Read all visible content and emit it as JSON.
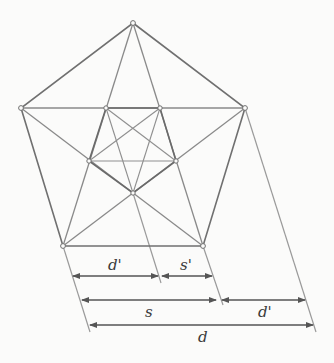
{
  "diagram": {
    "type": "geometric construction",
    "colors": {
      "outline": "#707070",
      "diagonal": "#8a8a8a",
      "dimension": "#555555",
      "background": "#fbfbfa"
    },
    "outer_pentagon": [
      {
        "id": "top",
        "x": 133,
        "y": 23
      },
      {
        "id": "right",
        "x": 245,
        "y": 108
      },
      {
        "id": "bottom-right",
        "x": 203,
        "y": 246
      },
      {
        "id": "bottom-left",
        "x": 63,
        "y": 246
      },
      {
        "id": "left",
        "x": 21,
        "y": 108
      }
    ],
    "inner_pentagon": [
      {
        "id": "inner-top-left",
        "x": 106,
        "y": 108
      },
      {
        "id": "inner-top-right",
        "x": 160,
        "y": 108
      },
      {
        "id": "inner-right",
        "x": 176,
        "y": 161
      },
      {
        "id": "inner-bottom",
        "x": 133,
        "y": 193
      },
      {
        "id": "inner-left",
        "x": 89,
        "y": 161
      }
    ],
    "dimensions": [
      {
        "label": "d'",
        "row": 1,
        "x1": 73,
        "x2": 158,
        "y": 276,
        "label_x": 108,
        "label_y": 256
      },
      {
        "label": "s'",
        "row": 1,
        "x1": 162,
        "x2": 212,
        "y": 276,
        "label_x": 180,
        "label_y": 256
      },
      {
        "label": "s",
        "row": 2,
        "x1": 82,
        "x2": 216,
        "y": 300,
        "label_x": 145,
        "label_y": 306
      },
      {
        "label": "d'",
        "row": 2,
        "x1": 222,
        "x2": 305,
        "y": 300,
        "label_x": 258,
        "label_y": 306
      },
      {
        "label": "d",
        "row": 3,
        "x1": 90,
        "x2": 313,
        "y": 325,
        "label_x": 198,
        "label_y": 331
      }
    ],
    "labels": {
      "d_prime_top": "d'",
      "s_prime": "s'",
      "s": "s",
      "d_prime_bottom": "d'",
      "d": "d"
    }
  }
}
